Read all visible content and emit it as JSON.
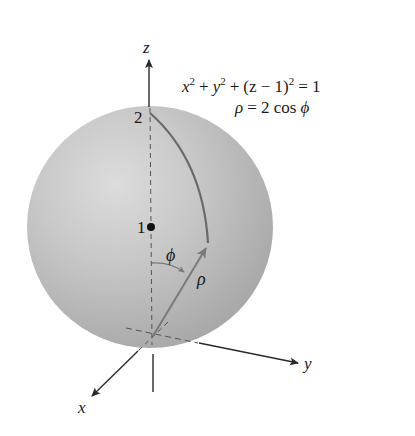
{
  "figure": {
    "equation_cartesian": {
      "x": "x",
      "y": "y",
      "z_minus": "(z − 1)",
      "exp": "2",
      "plus": "+",
      "equals": "= 1"
    },
    "equation_spherical": {
      "rho": "ρ",
      "rhs": "= 2 cos",
      "phi": "ϕ"
    },
    "axes": {
      "x_label": "x",
      "y_label": "y",
      "z_label": "z"
    },
    "tick_labels": {
      "z2": "2",
      "z1": "1"
    },
    "angle_label": "ϕ",
    "vector_label": "ρ",
    "colors": {
      "sphere_highlight": "#dadada",
      "sphere_mid": "#c4c4c4",
      "sphere_edge": "#a9a9a9",
      "arc": "#6a6a6a",
      "vector": "#7a7a7a",
      "axis": "#2a2a2a",
      "dashed": "#555555"
    }
  }
}
